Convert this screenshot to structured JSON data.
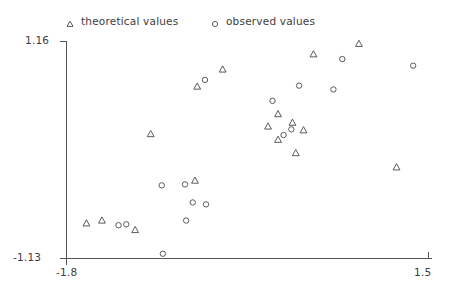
{
  "legend": {
    "entries": [
      {
        "label": "theoretical values",
        "marker": "triangle-marker",
        "color": "#4a4a4a"
      },
      {
        "label": "observed values",
        "marker": "circle-marker",
        "color": "#4a4a4a"
      }
    ]
  },
  "axes": {
    "y_top_label": "1.16",
    "y_bottom_label": "-1.13",
    "x_left_label": "-1.8",
    "x_right_label": "1.5"
  },
  "chart_data": {
    "type": "scatter",
    "title": "",
    "xlabel": "",
    "ylabel": "",
    "xlim": [
      -1.8,
      1.5
    ],
    "ylim": [
      -1.13,
      1.16
    ],
    "grid": false,
    "legend_position": "top",
    "series": [
      {
        "name": "theoretical values",
        "marker": "triangle",
        "color": "#4a4a4a",
        "points": [
          {
            "x": -1.04,
            "y": 0.18
          },
          {
            "x": -0.62,
            "y": 0.68
          },
          {
            "x": -0.39,
            "y": 0.86
          },
          {
            "x": 0.43,
            "y": 1.02
          },
          {
            "x": 0.84,
            "y": 1.13
          },
          {
            "x": 0.11,
            "y": 0.39
          },
          {
            "x": 0.02,
            "y": 0.26
          },
          {
            "x": 0.11,
            "y": 0.12
          },
          {
            "x": 0.24,
            "y": 0.3
          },
          {
            "x": 0.34,
            "y": 0.22
          },
          {
            "x": 0.27,
            "y": -0.02
          },
          {
            "x": -1.62,
            "y": -0.76
          },
          {
            "x": -1.48,
            "y": -0.73
          },
          {
            "x": -1.18,
            "y": -0.83
          },
          {
            "x": -0.64,
            "y": -0.31
          },
          {
            "x": 1.18,
            "y": -0.17
          }
        ]
      },
      {
        "name": "observed values",
        "marker": "circle",
        "color": "#4a4a4a",
        "points": [
          {
            "x": -0.55,
            "y": 0.75
          },
          {
            "x": 0.69,
            "y": 0.97
          },
          {
            "x": 0.3,
            "y": 0.69
          },
          {
            "x": 0.06,
            "y": 0.53
          },
          {
            "x": 0.61,
            "y": 0.65
          },
          {
            "x": 1.33,
            "y": 0.9
          },
          {
            "x": 0.16,
            "y": 0.17
          },
          {
            "x": 0.23,
            "y": 0.23
          },
          {
            "x": -1.33,
            "y": -0.78
          },
          {
            "x": -1.26,
            "y": -0.77
          },
          {
            "x": -0.94,
            "y": -0.36
          },
          {
            "x": -0.93,
            "y": -1.08
          },
          {
            "x": -0.54,
            "y": -0.56
          },
          {
            "x": -0.73,
            "y": -0.35
          },
          {
            "x": -0.66,
            "y": -0.54
          },
          {
            "x": -0.72,
            "y": -0.73
          }
        ]
      }
    ]
  }
}
